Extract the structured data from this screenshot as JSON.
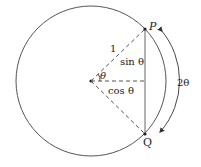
{
  "diagram": {
    "title": "",
    "labels": {
      "point_p": "P",
      "point_q": "Q",
      "radius": "1",
      "sin_label": "sin θ",
      "cos_label": "cos θ",
      "angle": "θ",
      "arc_label": "2θ"
    },
    "colors": {
      "stroke": "#555555",
      "text": "#222222",
      "background": "#ffffff"
    }
  }
}
